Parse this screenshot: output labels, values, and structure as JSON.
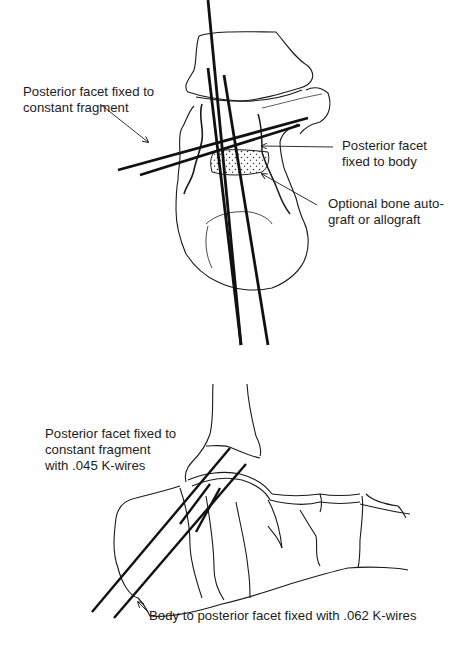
{
  "figure": {
    "panels": [
      {
        "view": "axial (posterior) view of calcaneus",
        "annotations": [
          {
            "id": "posterior-facet-constant-fragment",
            "text": "Posterior facet fixed to\nconstant fragment"
          },
          {
            "id": "posterior-facet-body",
            "text": "Posterior facet\nfixed to body"
          },
          {
            "id": "bone-graft",
            "text": "Optional bone auto-\ngraft or allograft"
          }
        ]
      },
      {
        "view": "lateral view of hindfoot",
        "annotations": [
          {
            "id": "posterior-facet-045",
            "text": "Posterior facet fixed to\nconstant fragment\nwith .045 K-wires"
          },
          {
            "id": "body-facet-062",
            "text": "Body to posterior facet fixed with .062 K-wires"
          }
        ]
      }
    ],
    "colors": {
      "line": "#1a1a1a",
      "background": "#ffffff"
    }
  }
}
